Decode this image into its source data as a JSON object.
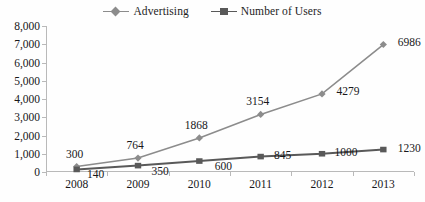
{
  "chart_data": {
    "type": "line",
    "title": "",
    "xlabel": "",
    "ylabel": "",
    "categories": [
      "2008",
      "2009",
      "2010",
      "2011",
      "2012",
      "2013"
    ],
    "ylim": [
      0,
      8000
    ],
    "ytick_step": 1000,
    "ytick_labels": [
      "0",
      "1,000",
      "2,000",
      "3,000",
      "4,000",
      "5,000",
      "6,000",
      "7,000",
      "8,000"
    ],
    "grid": false,
    "legend_position": "top-center",
    "series": [
      {
        "name": "Advertising",
        "marker": "diamond",
        "color": "#8c8c8c",
        "values": [
          300,
          764,
          1868,
          3154,
          4279,
          6986
        ],
        "labels": [
          "300",
          "764",
          "1868",
          "3154",
          "4279",
          "6986"
        ]
      },
      {
        "name": "Number of Users",
        "marker": "square",
        "color": "#595959",
        "values": [
          140,
          350,
          600,
          845,
          1000,
          1230
        ],
        "labels": [
          "140",
          "350",
          "600",
          "845",
          "1000",
          "1230"
        ]
      }
    ]
  },
  "legend": {
    "items": [
      {
        "label": "Advertising",
        "marker": "diamond",
        "color": "#8c8c8c"
      },
      {
        "label": "Number of Users",
        "marker": "square",
        "color": "#595959"
      }
    ]
  },
  "colors": {
    "advertising": "#8c8c8c",
    "users": "#595959",
    "axis": "#b9b9b9",
    "text": "#17171a",
    "background": "#fefefe"
  }
}
